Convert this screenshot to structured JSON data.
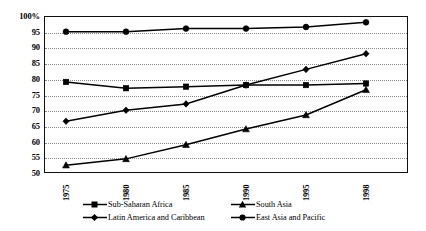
{
  "chart_data": {
    "type": "line",
    "title": "",
    "subtitle": "",
    "xlabel": "",
    "ylabel": "",
    "x": [
      "1975",
      "1980",
      "1985",
      "1990",
      "1995",
      "1998"
    ],
    "ylim": [
      50,
      100
    ],
    "xlim_labels": [
      "1975",
      "1998"
    ],
    "y_ticks": [
      "100%",
      "95",
      "90",
      "85",
      "80",
      "75",
      "70",
      "65",
      "60",
      "55",
      "50"
    ],
    "y_tick_values": [
      100,
      95,
      90,
      85,
      80,
      75,
      70,
      65,
      60,
      55,
      50
    ],
    "grid": true,
    "grid_style": "dotted-horizontal",
    "legend_position": "bottom",
    "series": [
      {
        "name": "Sub-Saharan Africa",
        "marker": "square",
        "values": [
          79,
          77,
          77.5,
          78,
          78,
          78.5
        ]
      },
      {
        "name": "South Asia",
        "marker": "triangle",
        "values": [
          52.5,
          54.5,
          59,
          64,
          68.5,
          76.5
        ]
      },
      {
        "name": "Latin America and Caribbean",
        "marker": "diamond",
        "values": [
          66.5,
          70,
          72,
          78,
          83,
          88
        ]
      },
      {
        "name": "East Asia and Pacific",
        "marker": "circle",
        "values": [
          95,
          95,
          96,
          96,
          96.5,
          98
        ]
      }
    ]
  },
  "legend": {
    "items": [
      {
        "label": "Sub-Saharan Africa",
        "marker": "square"
      },
      {
        "label": "South Asia",
        "marker": "triangle"
      },
      {
        "label": "Latin America and Caribbean",
        "marker": "diamond"
      },
      {
        "label": "East Asia and Pacific",
        "marker": "circle"
      }
    ]
  },
  "colors": {
    "series": "#000000",
    "frame": "#111111",
    "grid": "#8a8a8a",
    "background": "#ffffff"
  }
}
